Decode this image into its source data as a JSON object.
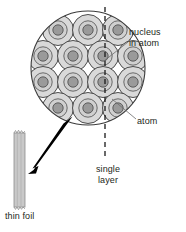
{
  "figure": {
    "type": "science-illustration"
  },
  "labels": {
    "nucleus_line1": "nucleus",
    "nucleus_line2": "in atom",
    "atom": "atom",
    "single_layer_line1": "single",
    "single_layer_line2": "layer",
    "thin_foil": "thin foil"
  },
  "colors": {
    "atom_fill": "#d9d9d9",
    "nucleus_fill": "#9a9a9a",
    "outline": "#3b3b3b",
    "foil_fill": "#c9c9c9",
    "arrow": "#000000",
    "dash_line": "#1a1a1a",
    "text": "#231f20",
    "background": "#ffffff"
  },
  "structure": {
    "magnifier_circle": {
      "cx": 88,
      "cy": 68,
      "r": 57
    },
    "atom_radius": 15.5,
    "nucleus_radius": 6,
    "atom_grid_rows": 4,
    "atom_grid_cols": 5,
    "dashed_line": {
      "x": 105,
      "y_top": 8,
      "y_bottom": 158
    },
    "foil": {
      "x": 14,
      "y": 132,
      "width": 11,
      "height": 76
    },
    "arrow": {
      "from_x": 68,
      "from_y": 118,
      "to_x": 29,
      "to_y": 173
    }
  },
  "atoms": [
    {
      "cx": 58,
      "cy": 30
    },
    {
      "cx": 88,
      "cy": 30
    },
    {
      "cx": 118,
      "cy": 30
    },
    {
      "cx": 43,
      "cy": 56
    },
    {
      "cx": 73,
      "cy": 56
    },
    {
      "cx": 103,
      "cy": 56
    },
    {
      "cx": 133,
      "cy": 56
    },
    {
      "cx": 43,
      "cy": 82
    },
    {
      "cx": 73,
      "cy": 82
    },
    {
      "cx": 103,
      "cy": 82
    },
    {
      "cx": 133,
      "cy": 82
    },
    {
      "cx": 58,
      "cy": 108
    },
    {
      "cx": 88,
      "cy": 108
    },
    {
      "cx": 118,
      "cy": 108
    }
  ]
}
